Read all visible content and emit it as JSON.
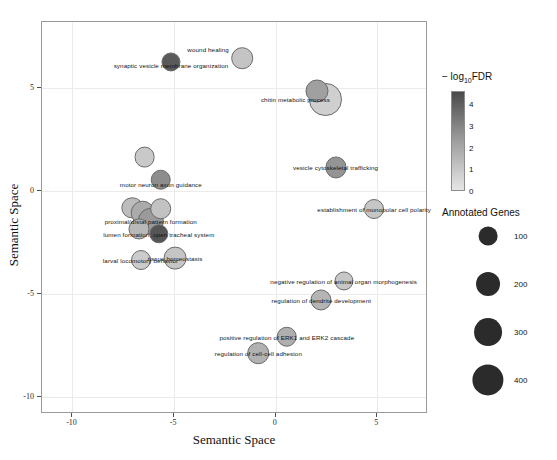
{
  "chart_data": {
    "type": "scatter",
    "title": "",
    "xlabel": "Semantic Space",
    "ylabel": "Semantic Space",
    "xlim": [
      -11.5,
      7.5
    ],
    "ylim": [
      -10.8,
      8.2
    ],
    "xticks": [
      -10,
      -5,
      0,
      5
    ],
    "yticks": [
      5,
      0,
      -5,
      -10
    ],
    "xtick_labels": [
      "-10",
      "-5",
      "0",
      "5"
    ],
    "ytick_labels": [
      "5",
      "0",
      "-5",
      "-10"
    ],
    "grid": true,
    "legend_position": "right",
    "color_scale": {
      "label": "− log10FDR",
      "label_prefix": "− log",
      "label_sub": "10",
      "label_suffix": "FDR",
      "ticks": [
        4,
        3,
        2,
        1,
        0
      ],
      "tick_labels": [
        "4",
        "3",
        "2",
        "1",
        "0"
      ],
      "low_color": "#e6e6e6",
      "high_color": "#4a4a4a"
    },
    "size_scale": {
      "label": "Annotated Genes",
      "breaks": [
        100,
        200,
        300,
        400
      ],
      "break_labels": [
        "100",
        "200",
        "300",
        "400"
      ],
      "color": "#2b2b2b"
    },
    "points": [
      {
        "label": "wound healing",
        "x": -1.6,
        "y": 6.4,
        "genes": 150,
        "fdr": 1.2,
        "color": "#c4c4c4",
        "lab_dx": -34,
        "lab_dy": -9
      },
      {
        "label": "synaptic vesicle membrane organization",
        "x": -5.1,
        "y": 6.2,
        "genes": 105,
        "fdr": 4.2,
        "color": "#5a5a5a",
        "lab_dx": 0,
        "lab_dy": 3
      },
      {
        "label": "chitin metabolic process",
        "x": 2.5,
        "y": 4.4,
        "genes": 430,
        "fdr": 0.6,
        "color": "#cfcfcf",
        "lab_dx": -30,
        "lab_dy": 0
      },
      {
        "label": "",
        "x": 2.1,
        "y": 4.8,
        "genes": 180,
        "fdr": 2.0,
        "color": "#a0a0a0",
        "lab_dx": 0,
        "lab_dy": 0
      },
      {
        "label": "",
        "x": -6.4,
        "y": 1.6,
        "genes": 135,
        "fdr": 1.0,
        "color": "#c9c9c9",
        "lab_dx": 0,
        "lab_dy": 0
      },
      {
        "label": "motor neuron axon guidance",
        "x": -5.6,
        "y": 0.5,
        "genes": 130,
        "fdr": 2.6,
        "color": "#8d8d8d",
        "lab_dx": 0,
        "lab_dy": 4
      },
      {
        "label": "vesicle cytoskeletal trafficking",
        "x": 3.0,
        "y": 1.1,
        "genes": 140,
        "fdr": 2.4,
        "color": "#949494",
        "lab_dx": 0,
        "lab_dy": 0
      },
      {
        "label": "establishment of monopolar cell polarity",
        "x": 4.9,
        "y": -0.9,
        "genes": 120,
        "fdr": 0.9,
        "color": "#c6c6c6",
        "lab_dx": 0,
        "lab_dy": 0
      },
      {
        "label": "",
        "x": -7.0,
        "y": -0.85,
        "genes": 145,
        "fdr": 1.3,
        "color": "#bdbdbd",
        "lab_dx": 0,
        "lab_dy": 0
      },
      {
        "label": "",
        "x": -6.5,
        "y": -1.1,
        "genes": 215,
        "fdr": 1.8,
        "color": "#ababab",
        "lab_dx": 0,
        "lab_dy": 0
      },
      {
        "label": "proximal/distal pattern formation",
        "x": -6.1,
        "y": -1.5,
        "genes": 260,
        "fdr": 2.3,
        "color": "#9a9a9a",
        "lab_dx": 0,
        "lab_dy": 0
      },
      {
        "label": "",
        "x": -5.6,
        "y": -0.9,
        "genes": 150,
        "fdr": 1.1,
        "color": "#c2c2c2",
        "lab_dx": 0,
        "lab_dy": 0
      },
      {
        "label": "",
        "x": -6.7,
        "y": -1.9,
        "genes": 140,
        "fdr": 1.4,
        "color": "#b8b8b8",
        "lab_dx": 0,
        "lab_dy": 0
      },
      {
        "label": "lumen formation, open tracheal system",
        "x": -5.7,
        "y": -2.1,
        "genes": 110,
        "fdr": 4.4,
        "color": "#555555",
        "lab_dx": 0,
        "lab_dy": 0
      },
      {
        "label": "larval locomotory behavior",
        "x": -6.6,
        "y": -3.4,
        "genes": 120,
        "fdr": 0.8,
        "color": "#cbcbcb",
        "lab_dx": 0,
        "lab_dy": 0
      },
      {
        "label": "tissue homeostasis",
        "x": -4.9,
        "y": -3.3,
        "genes": 175,
        "fdr": 1.0,
        "color": "#c5c5c5",
        "lab_dx": 0,
        "lab_dy": 0
      },
      {
        "label": "negative regulation of animal organ morphogenesis",
        "x": 3.4,
        "y": -4.4,
        "genes": 105,
        "fdr": 1.0,
        "color": "#c7c7c7",
        "lab_dx": 0,
        "lab_dy": 0
      },
      {
        "label": "regulation of dendrite development",
        "x": 2.3,
        "y": -5.3,
        "genes": 140,
        "fdr": 1.5,
        "color": "#b4b4b4",
        "lab_dx": 0,
        "lab_dy": 0
      },
      {
        "label": "positive regulation of ERK1 and ERK2 cascade",
        "x": 0.6,
        "y": -7.1,
        "genes": 130,
        "fdr": 1.7,
        "color": "#afafaf",
        "lab_dx": 0,
        "lab_dy": 0
      },
      {
        "label": "regulation of cell-cell adhesion",
        "x": -0.8,
        "y": -7.9,
        "genes": 150,
        "fdr": 1.6,
        "color": "#b2b2b2",
        "lab_dx": 0,
        "lab_dy": 0
      }
    ]
  }
}
